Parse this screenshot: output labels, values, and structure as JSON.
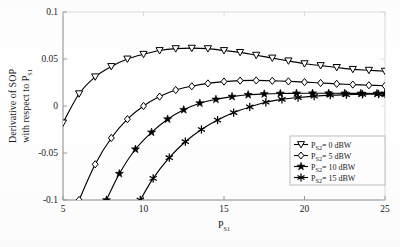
{
  "chart_data": {
    "type": "line",
    "title": "",
    "xlabel": "P_S1",
    "xlabel_main": "P",
    "xlabel_sub": "S1",
    "ylabel": "Derivative of SOP with respect to P_S1",
    "ylabel_line1": "Derivative of SOP",
    "ylabel_line2_main": "with respect to P",
    "ylabel_line2_sub": "S1",
    "xlim": [
      5,
      25
    ],
    "ylim": [
      -0.1,
      0.1
    ],
    "xticks": [
      5,
      10,
      15,
      20,
      25
    ],
    "xtick_labels": [
      "5",
      "10",
      "15",
      "20",
      "25"
    ],
    "yticks": [
      -0.1,
      -0.05,
      0,
      0.05,
      0.1
    ],
    "ytick_labels": [
      "-0.1",
      "-0.05",
      "0",
      "0.05",
      "0.1"
    ],
    "grid": false,
    "legend_position": "lower right",
    "line_color": "#000000",
    "series": [
      {
        "name": "P_S2 = 0 dBW",
        "label_main": "P",
        "label_sub": "S2",
        "label_rest": "= 0 dBW",
        "marker": "triangle-down",
        "x": [
          5,
          6,
          7,
          8,
          9,
          10,
          11,
          12,
          13,
          14,
          15,
          16,
          17,
          18,
          19,
          20,
          21,
          22,
          23,
          24,
          25
        ],
        "y": [
          -0.018,
          0.013,
          0.031,
          0.042,
          0.05,
          0.055,
          0.059,
          0.061,
          0.0615,
          0.061,
          0.059,
          0.057,
          0.054,
          0.051,
          0.048,
          0.045,
          0.043,
          0.041,
          0.039,
          0.038,
          0.037
        ]
      },
      {
        "name": "P_S2 = 5 dBW",
        "label_main": "P",
        "label_sub": "S2",
        "label_rest": "= 5 dBW",
        "marker": "diamond",
        "x": [
          6,
          7,
          8,
          9,
          10,
          11,
          12,
          13,
          14,
          15,
          16,
          17,
          18,
          19,
          20,
          21,
          22,
          23,
          24,
          25
        ],
        "y": [
          -0.1,
          -0.062,
          -0.034,
          -0.014,
          0.0,
          0.01,
          0.017,
          0.021,
          0.024,
          0.026,
          0.027,
          0.0272,
          0.0268,
          0.0262,
          0.0254,
          0.0245,
          0.0236,
          0.0228,
          0.0221,
          0.0215
        ]
      },
      {
        "name": "P_S2 = 10 dBW",
        "label_main": "P",
        "label_sub": "S2",
        "label_rest": "= 10 dBW",
        "marker": "star",
        "x": [
          7.7,
          8.5,
          9.5,
          10.5,
          11.5,
          12.5,
          13.5,
          14.5,
          15.5,
          16.5,
          17.5,
          18.5,
          19.5,
          20.5,
          21.5,
          22.5,
          23.5,
          24.5,
          25
        ],
        "y": [
          -0.1,
          -0.072,
          -0.046,
          -0.028,
          -0.014,
          -0.004,
          0.003,
          0.007,
          0.01,
          0.012,
          0.0128,
          0.0133,
          0.0135,
          0.0136,
          0.0136,
          0.0135,
          0.0134,
          0.0133,
          0.0132
        ]
      },
      {
        "name": "P_S2 = 15 dBW",
        "label_main": "P",
        "label_sub": "S2",
        "label_rest": "= 15 dBW",
        "marker": "asterisk",
        "x": [
          9.8,
          10.6,
          11.6,
          12.6,
          13.6,
          14.6,
          15.6,
          16.6,
          17.6,
          18.6,
          19.6,
          20.6,
          21.6,
          22.6,
          23.6,
          24.6,
          25
        ],
        "y": [
          -0.1,
          -0.077,
          -0.055,
          -0.038,
          -0.025,
          -0.015,
          -0.007,
          -0.001,
          0.004,
          0.007,
          0.009,
          0.0105,
          0.0115,
          0.012,
          0.0124,
          0.0127,
          0.0128
        ]
      }
    ]
  }
}
